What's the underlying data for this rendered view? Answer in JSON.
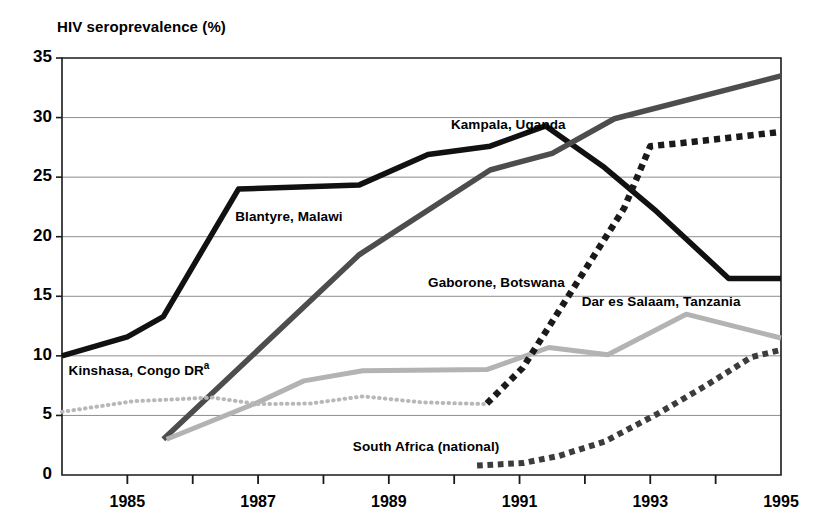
{
  "chart_data": {
    "type": "line",
    "title": "HIV seroprevalence (%)",
    "xlabel": "",
    "ylabel": "HIV seroprevalence (%)",
    "xlim": [
      1984,
      1995
    ],
    "ylim": [
      0,
      35
    ],
    "yticks": [
      0,
      5,
      10,
      15,
      20,
      25,
      30,
      35
    ],
    "ytick_labels": [
      "0",
      "5",
      "10",
      "15",
      "20",
      "25",
      "30",
      "35"
    ],
    "xticks": [
      1984,
      1985,
      1986,
      1987,
      1988,
      1989,
      1990,
      1991,
      1992,
      1993,
      1994,
      1995
    ],
    "xtick_labels": [
      "1985",
      "1987",
      "1989",
      "1991",
      "1993",
      "1995"
    ],
    "xtick_label_values": [
      1985,
      1987,
      1989,
      1991,
      1993,
      1995
    ],
    "grid": "horizontal",
    "legend": "inline-annotations",
    "series": [
      {
        "name": "Kampala, Uganda",
        "style": "solid",
        "color": "#111111",
        "width": 5.5,
        "label_x": 1989.95,
        "label_y": 29.3,
        "points": [
          [
            1984.0,
            10.0
          ],
          [
            1985.0,
            11.6
          ],
          [
            1985.55,
            13.3
          ],
          [
            1986.7,
            24.0
          ],
          [
            1988.55,
            24.35
          ],
          [
            1989.6,
            26.9
          ],
          [
            1990.55,
            27.6
          ],
          [
            1991.4,
            29.3
          ],
          [
            1992.3,
            25.8
          ],
          [
            1993.1,
            22.1
          ],
          [
            1994.2,
            16.5
          ],
          [
            1995.0,
            16.5
          ]
        ]
      },
      {
        "name": "Blantyre, Malawi",
        "style": "solid",
        "color": "#4d4d4d",
        "width": 5.5,
        "label_x": 1986.65,
        "label_y": 21.6,
        "points": [
          [
            1985.55,
            3.0
          ],
          [
            1988.55,
            18.5
          ],
          [
            1990.55,
            25.6
          ],
          [
            1991.5,
            27.0
          ],
          [
            1992.45,
            29.9
          ],
          [
            1995.0,
            33.5
          ]
        ]
      },
      {
        "name": "Dar es Salaam, Tanzania",
        "style": "solid",
        "color": "#b3b3b3",
        "width": 5.0,
        "label_x": 1991.95,
        "label_y": 14.4,
        "points": [
          [
            1985.6,
            3.0
          ],
          [
            1987.0,
            6.1
          ],
          [
            1987.7,
            7.9
          ],
          [
            1988.6,
            8.75
          ],
          [
            1990.5,
            8.85
          ],
          [
            1991.45,
            10.7
          ],
          [
            1992.35,
            10.1
          ],
          [
            1993.55,
            13.5
          ],
          [
            1995.0,
            11.5
          ]
        ]
      },
      {
        "name": "Kinshasa, Congo DR",
        "style": "fine-dotted",
        "color": "#b8b8b8",
        "width": 4.0,
        "label_x": 1984.1,
        "label_y": 8.9,
        "superscript": "a",
        "points": [
          [
            1984.0,
            5.3
          ],
          [
            1985.1,
            6.2
          ],
          [
            1986.3,
            6.5
          ],
          [
            1987.0,
            5.95
          ],
          [
            1987.8,
            6.0
          ],
          [
            1988.6,
            6.6
          ],
          [
            1989.5,
            6.1
          ],
          [
            1990.5,
            5.95
          ]
        ]
      },
      {
        "name": "Gaborone, Botswana",
        "style": "bold-dotted",
        "color": "#1a1a1a",
        "width": 6.5,
        "label_x": 1989.6,
        "label_y": 16.0,
        "points": [
          [
            1990.5,
            6.0
          ],
          [
            1991.05,
            9.0
          ],
          [
            1992.0,
            17.2
          ],
          [
            1992.6,
            22.4
          ],
          [
            1993.0,
            27.6
          ],
          [
            1993.55,
            27.9
          ],
          [
            1995.0,
            28.8
          ]
        ]
      },
      {
        "name": "South Africa (national)",
        "style": "bold-dotted",
        "color": "#3c3c3c",
        "width": 6.0,
        "label_x": 1988.45,
        "label_y": 2.3,
        "points": [
          [
            1990.35,
            0.8
          ],
          [
            1991.05,
            1.0
          ],
          [
            1991.6,
            1.6
          ],
          [
            1992.3,
            2.8
          ],
          [
            1993.1,
            5.1
          ],
          [
            1993.85,
            7.5
          ],
          [
            1994.55,
            9.9
          ],
          [
            1995.0,
            10.5
          ]
        ]
      }
    ]
  },
  "axes": {
    "axis_color": "#1a1a1a",
    "grid_color": "#8d8d8d"
  }
}
